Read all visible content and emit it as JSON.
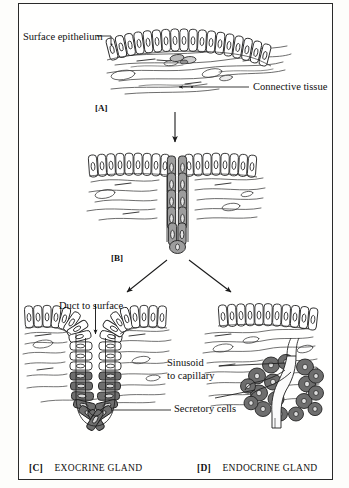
{
  "figure": {
    "title_cropped": "",
    "labels": {
      "surface_epithelium": "Surface epithelium",
      "connective_tissue": "Connective tissue",
      "duct_to_surface": "Duct to surface",
      "sinusoid_line1": "Sinusoid",
      "sinusoid_line2": "to capillary",
      "secretory_cells_c": "Secretory cells",
      "secretory_cells_d": "Secretory cells"
    },
    "panels": [
      {
        "tag": "[A]",
        "caption": ""
      },
      {
        "tag": "[B]",
        "caption": ""
      },
      {
        "tag": "[C]",
        "caption": "EXOCRINE GLAND"
      },
      {
        "tag": "[D]",
        "caption": "ENDOCRINE GLAND"
      }
    ],
    "colors": {
      "ink": "#1a1a1a",
      "frame": "#2a2a2a",
      "secretory_dark": "#6e6e6e",
      "secretory_mid": "#9a9a9a",
      "epithelium_fill": "#ffffff",
      "tissue_stroke": "#3a3a3a",
      "page": "#fdfdfb"
    }
  }
}
